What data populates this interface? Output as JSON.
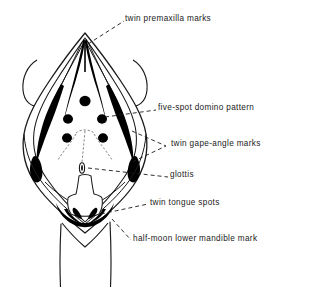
{
  "figure": {
    "type": "anatomical-line-drawing",
    "stroke_color": "#1a1a1a",
    "fill_color": "#000000",
    "background_color": "#ffffff",
    "leader_line_style": "dashed"
  },
  "labels": {
    "twin_premaxilla_marks": "twin premaxilla marks",
    "five_spot_domino_pattern": "five-spot domino pattern",
    "twin_gape_angle_marks": "twin gape-angle marks",
    "glottis": "glottis",
    "twin_tongue_spots": "twin tongue spots",
    "half_moon_lower_mandible_mark": "half-moon lower mandible mark"
  },
  "annotated_features": [
    {
      "name": "twin premaxilla marks",
      "count": 2,
      "location": "upper apex of gape"
    },
    {
      "name": "five-spot domino pattern",
      "count": 5,
      "location": "palate"
    },
    {
      "name": "twin gape-angle marks",
      "count": 2,
      "location": "gape corners, both sides"
    },
    {
      "name": "glottis",
      "count": 1,
      "location": "mid floor of mouth"
    },
    {
      "name": "twin tongue spots",
      "count": 2,
      "location": "tongue tip"
    },
    {
      "name": "half-moon lower mandible mark",
      "count": 1,
      "location": "lower mandible"
    }
  ]
}
